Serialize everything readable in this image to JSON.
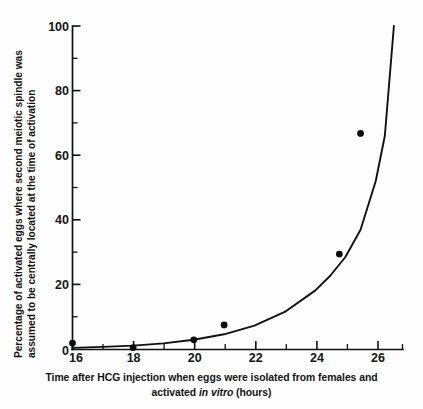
{
  "chart_data": {
    "type": "scatter",
    "title": "",
    "xlabel_line1": "Time after HCG injection when eggs were isolated from females  and",
    "xlabel_line2_pre": "activated ",
    "xlabel_line2_italic": "in vitro",
    "xlabel_line2_post": " (hours)",
    "ylabel_line1": "Percentage of activated eggs where second meiotic spindle was",
    "ylabel_line2": "assumed to be centrally located at the time of activation",
    "xlabel": "Time after HCG injection when eggs were isolated from females and activated in vitro (hours)",
    "ylabel": "Percentage of activated eggs where second meiotic spindle was assumed to be centrally located at the time of activation",
    "xlim": [
      16,
      26.9
    ],
    "ylim": [
      0,
      100
    ],
    "x_ticks": [
      16,
      18,
      20,
      22,
      24,
      26
    ],
    "x_tick_labels": [
      "16",
      "18",
      "20",
      "22",
      "24",
      "26"
    ],
    "x_minor_ticks": [
      17,
      19,
      21,
      23,
      25,
      26.9
    ],
    "y_ticks": [
      0,
      20,
      40,
      60,
      80,
      100
    ],
    "y_tick_labels": [
      "0",
      "20",
      "40",
      "60",
      "80",
      "100"
    ],
    "y_minor_ticks": [
      10,
      30,
      50,
      70,
      90
    ],
    "grid": false,
    "legend": "none",
    "points": [
      {
        "x": 16.0,
        "y": 2.0
      },
      {
        "x": 18.0,
        "y": 0.6
      },
      {
        "x": 20.0,
        "y": 3.0
      },
      {
        "x": 21.0,
        "y": 7.6
      },
      {
        "x": 24.8,
        "y": 29.5
      },
      {
        "x": 25.5,
        "y": 66.8
      }
    ],
    "fitted_curve": {
      "description": "exponential fit through the data points",
      "x": [
        16.0,
        17.0,
        18.0,
        19.0,
        20.0,
        21.0,
        22.0,
        23.0,
        24.0,
        24.5,
        25.0,
        25.5,
        26.0,
        26.3,
        26.6
      ],
      "y": [
        0.5,
        0.8,
        1.2,
        1.9,
        3.0,
        4.7,
        7.4,
        11.6,
        18.2,
        22.8,
        28.6,
        37.0,
        52.0,
        66.0,
        100.0
      ]
    }
  }
}
